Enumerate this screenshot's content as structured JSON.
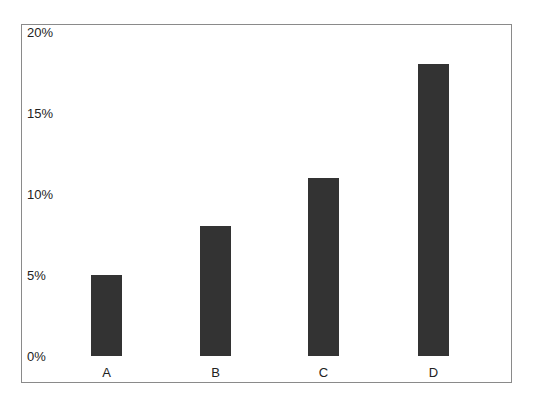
{
  "chart_data": {
    "type": "bar",
    "title": "",
    "xlabel": "",
    "ylabel": "",
    "categories": [
      "A",
      "B",
      "C",
      "D"
    ],
    "values": [
      5,
      8,
      11,
      18
    ],
    "value_unit": "%",
    "ylim": [
      0,
      20
    ],
    "yticks": [
      "0%",
      "5%",
      "10%",
      "15%",
      "20%"
    ],
    "grid": false,
    "legend": null,
    "bar_color": "#333333"
  }
}
